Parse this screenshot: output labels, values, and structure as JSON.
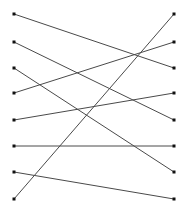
{
  "figure": {
    "title": "",
    "type": "bipartite-matching-diagram",
    "width": 189,
    "height": 208,
    "background_color": "#ffffff",
    "edge_color": "#4a4a4a",
    "node_color": "#111111",
    "node_size": 3,
    "edge_width": 1
  },
  "chart_data": {
    "type": "scatter",
    "title": "",
    "xlabel": "",
    "ylabel": "",
    "grid": false,
    "legend": "none",
    "xlim": [
      0,
      189
    ],
    "ylim": [
      0,
      208
    ],
    "left_nodes": [
      {
        "id": "L1",
        "x": 14,
        "y": 14
      },
      {
        "id": "L2",
        "x": 14,
        "y": 42
      },
      {
        "id": "L3",
        "x": 14,
        "y": 68
      },
      {
        "id": "L4",
        "x": 14,
        "y": 93
      },
      {
        "id": "L5",
        "x": 14,
        "y": 120
      },
      {
        "id": "L6",
        "x": 14,
        "y": 146
      },
      {
        "id": "L7",
        "x": 14,
        "y": 172
      },
      {
        "id": "L8",
        "x": 14,
        "y": 199
      }
    ],
    "right_nodes": [
      {
        "id": "R1",
        "x": 174,
        "y": 14
      },
      {
        "id": "R2",
        "x": 174,
        "y": 42
      },
      {
        "id": "R3",
        "x": 174,
        "y": 68
      },
      {
        "id": "R4",
        "x": 174,
        "y": 93
      },
      {
        "id": "R5",
        "x": 174,
        "y": 120
      },
      {
        "id": "R6",
        "x": 174,
        "y": 146
      },
      {
        "id": "R7",
        "x": 174,
        "y": 172
      },
      {
        "id": "R8",
        "x": 174,
        "y": 199
      }
    ],
    "edges": [
      {
        "from": "L1",
        "to": "R3",
        "x1": 14,
        "y1": 14,
        "x2": 174,
        "y2": 68
      },
      {
        "from": "L2",
        "to": "R5",
        "x1": 14,
        "y1": 42,
        "x2": 174,
        "y2": 120
      },
      {
        "from": "L3",
        "to": "R7",
        "x1": 14,
        "y1": 68,
        "x2": 174,
        "y2": 172
      },
      {
        "from": "L4",
        "to": "R2",
        "x1": 14,
        "y1": 93,
        "x2": 174,
        "y2": 42
      },
      {
        "from": "L5",
        "to": "R4",
        "x1": 14,
        "y1": 120,
        "x2": 174,
        "y2": 93
      },
      {
        "from": "L6",
        "to": "R6",
        "x1": 14,
        "y1": 146,
        "x2": 174,
        "y2": 146
      },
      {
        "from": "L7",
        "to": "R8",
        "x1": 14,
        "y1": 172,
        "x2": 174,
        "y2": 199
      },
      {
        "from": "L8",
        "to": "R1",
        "x1": 14,
        "y1": 199,
        "x2": 174,
        "y2": 14
      }
    ]
  }
}
